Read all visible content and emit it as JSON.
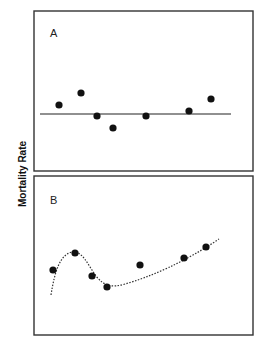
{
  "chart_data": [
    {
      "type": "scatter",
      "panel": "A",
      "title": "",
      "xlabel": "",
      "ylabel": "Mortality Rate",
      "grid": false,
      "points": [
        {
          "x": 59,
          "y": 105
        },
        {
          "x": 81,
          "y": 93
        },
        {
          "x": 97,
          "y": 116
        },
        {
          "x": 113,
          "y": 128
        },
        {
          "x": 146,
          "y": 116
        },
        {
          "x": 189,
          "y": 111
        },
        {
          "x": 211,
          "y": 99
        }
      ],
      "fit": {
        "style": "solid",
        "kind": "flat line",
        "path": "M40 114 L231 114"
      }
    },
    {
      "type": "scatter",
      "panel": "B",
      "title": "",
      "xlabel": "",
      "ylabel": "Mortality Rate",
      "grid": false,
      "points": [
        {
          "x": 53,
          "y": 270
        },
        {
          "x": 75,
          "y": 253
        },
        {
          "x": 92,
          "y": 276
        },
        {
          "x": 107,
          "y": 287
        },
        {
          "x": 140,
          "y": 265
        },
        {
          "x": 184,
          "y": 258
        },
        {
          "x": 206,
          "y": 247
        }
      ],
      "fit": {
        "style": "dotted",
        "kind": "nonlinear curve",
        "path": "M51 295 C55 270 60 255 72 252 C82 250 88 265 96 276 C104 286 112 288 125 284 C150 277 185 262 219 239"
      }
    }
  ],
  "figure": {
    "ylabel": "Mortality Rate",
    "panels": [
      {
        "letter": "A"
      },
      {
        "letter": "B"
      }
    ]
  }
}
